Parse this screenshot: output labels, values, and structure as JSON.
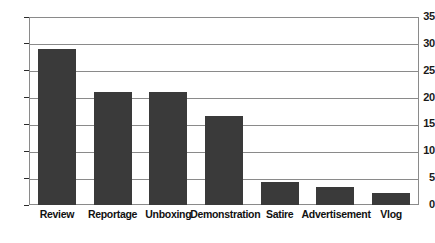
{
  "chart_data": {
    "type": "bar",
    "title": "",
    "subtitle": "",
    "xlabel": "",
    "ylabel": "",
    "categories": [
      "Review",
      "Reportage",
      "Unboxing",
      "Demonstration",
      "Satire",
      "Advertisement",
      "Vlog"
    ],
    "values": [
      29,
      21,
      21,
      16.5,
      4.3,
      3.3,
      2.3
    ],
    "ylim": [
      0,
      35
    ],
    "ytick_step": 5,
    "yticks": [
      0,
      5,
      10,
      15,
      20,
      25,
      30,
      35
    ],
    "ytick_labels": [
      "0",
      "5",
      "10",
      "15",
      "20",
      "25",
      "30",
      "35"
    ],
    "grid": true,
    "grid_axis": "y",
    "legend": false,
    "legend_position": "none",
    "bar_color": "#3a3a3a",
    "grid_color": "#8a8a8a",
    "frame_color": "#8a8a8a",
    "background_color": "#ffffff",
    "text_color": "#111111",
    "orientation": "vertical"
  }
}
